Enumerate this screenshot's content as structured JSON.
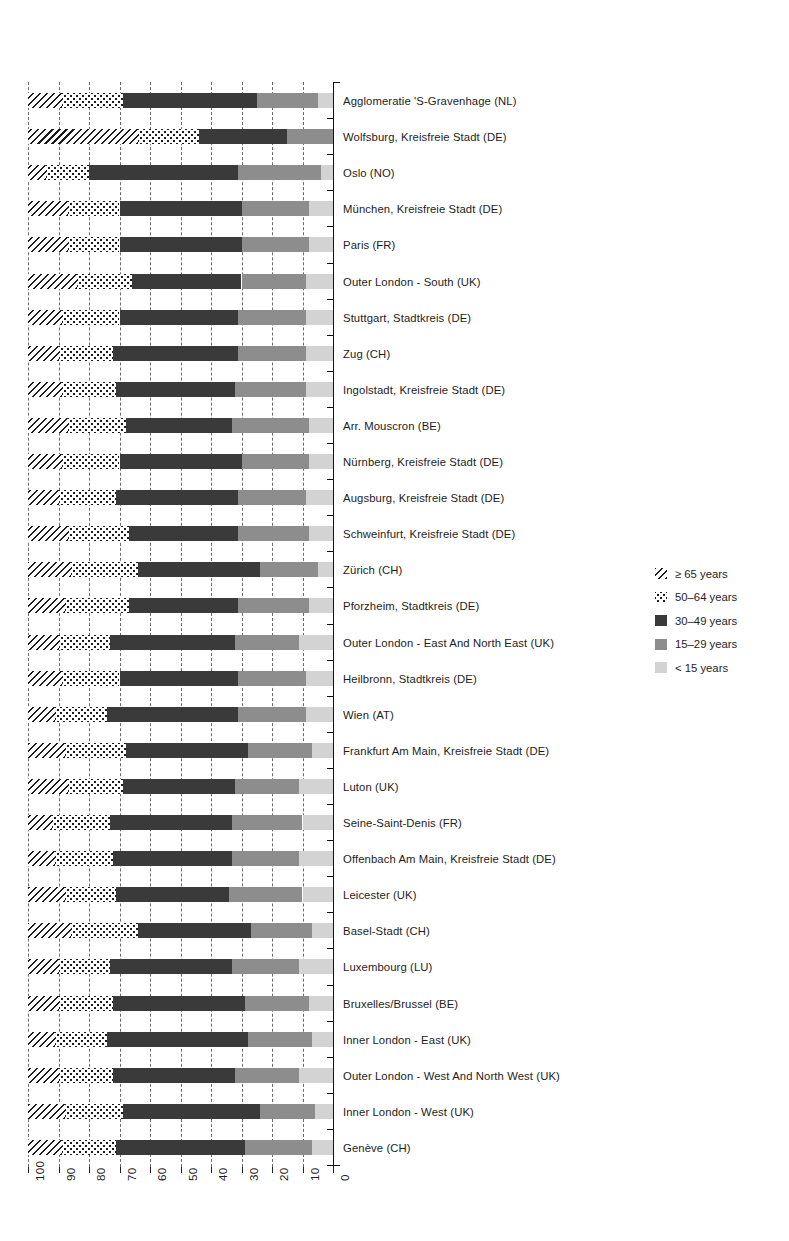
{
  "chart_data": {
    "type": "bar",
    "subtype": "horizontal-stacked-100-percent",
    "title": "",
    "xlabel": "",
    "ylabel": "",
    "xlim": [
      100,
      0
    ],
    "x_axis_reversed": true,
    "xticks": [
      100,
      90,
      80,
      70,
      60,
      50,
      40,
      30,
      20,
      10,
      0
    ],
    "xtick_labels": [
      "100",
      "90",
      "80",
      "70",
      "60",
      "50",
      "40",
      "30",
      "20",
      "10",
      "0"
    ],
    "grid": true,
    "grid_style": "dashed-vertical",
    "legend_position": "right",
    "series": [
      {
        "name": "≥ 65 years",
        "key": "age65p",
        "fill": "diagonal-hatch",
        "color": "#1c1c1c"
      },
      {
        "name": "50–64 years",
        "key": "age5064",
        "fill": "dotted",
        "color": "#1c1c1c"
      },
      {
        "name": "30–49 years",
        "key": "age3049",
        "fill": "solid",
        "color": "#3a3a3a"
      },
      {
        "name": "15–29 years",
        "key": "age1529",
        "fill": "solid",
        "color": "#8d8d8d"
      },
      {
        "name": "< 15 years",
        "key": "age0014",
        "fill": "solid",
        "color": "#d3d3d3"
      }
    ],
    "categories": [
      "Agglomeratie 'S-Gravenhage (NL)",
      "Wolfsburg, Kreisfreie Stadt (DE)",
      "Oslo (NO)",
      "München, Kreisfreie Stadt (DE)",
      "Paris (FR)",
      "Outer London - South (UK)",
      "Stuttgart, Stadtkreis (DE)",
      "Zug (CH)",
      "Ingolstadt, Kreisfreie Stadt (DE)",
      "Arr. Mouscron (BE)",
      "Nürnberg, Kreisfreie Stadt (DE)",
      "Augsburg, Kreisfreie Stadt (DE)",
      "Schweinfurt, Kreisfreie Stadt (DE)",
      "Zürich (CH)",
      "Pforzheim, Stadtkreis (DE)",
      "Outer London - East And North East (UK)",
      "Heilbronn, Stadtkreis (DE)",
      "Wien (AT)",
      "Frankfurt Am Main, Kreisfreie Stadt (DE)",
      "Luton (UK)",
      "Seine-Saint-Denis (FR)",
      "Offenbach Am Main, Kreisfreie Stadt (DE)",
      "Leicester (UK)",
      "Basel-Stadt (CH)",
      "Luxembourg (LU)",
      "Bruxelles/Brussel (BE)",
      "Inner London - East (UK)",
      "Outer London - West And North West (UK)",
      "Inner London - West (UK)",
      "Genève (CH)"
    ],
    "values": {
      "age65p": [
        11,
        36,
        6,
        13,
        13,
        16,
        11,
        10,
        11,
        13,
        11,
        10,
        13,
        14,
        12,
        10,
        11,
        9,
        12,
        13,
        8,
        9,
        12,
        14,
        10,
        10,
        9,
        10,
        12,
        11
      ],
      "age5064": [
        20,
        20,
        14,
        17,
        17,
        18,
        19,
        18,
        18,
        19,
        19,
        19,
        20,
        22,
        21,
        17,
        19,
        17,
        20,
        18,
        19,
        19,
        17,
        22,
        17,
        18,
        17,
        18,
        19,
        18
      ],
      "age3049": [
        44,
        29,
        49,
        40,
        40,
        36,
        39,
        41,
        39,
        35,
        40,
        40,
        36,
        40,
        36,
        41,
        39,
        43,
        40,
        37,
        40,
        39,
        37,
        37,
        40,
        43,
        46,
        40,
        45,
        42
      ],
      "age1529": [
        20,
        15,
        27,
        22,
        22,
        21,
        22,
        22,
        23,
        25,
        22,
        22,
        23,
        19,
        23,
        21,
        22,
        22,
        21,
        21,
        23,
        22,
        24,
        20,
        22,
        21,
        21,
        21,
        18,
        22
      ],
      "age0014": [
        5,
        0,
        4,
        8,
        8,
        9,
        9,
        9,
        9,
        8,
        8,
        9,
        8,
        5,
        8,
        11,
        9,
        9,
        7,
        11,
        10,
        11,
        10,
        7,
        11,
        8,
        7,
        11,
        6,
        7
      ]
    }
  }
}
